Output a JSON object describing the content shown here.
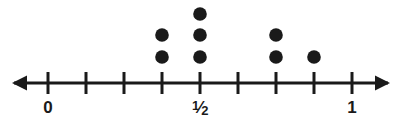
{
  "figure": {
    "name": "dot-plot-number-line",
    "width": 401,
    "height": 126,
    "background": "#ffffff",
    "ink_color": "#1a1a1a"
  },
  "axis": {
    "type": "number-line",
    "orientation": "horizontal",
    "y": 83,
    "line_start_x": 14,
    "line_end_x": 388,
    "stroke_width": 3,
    "left_arrowhead": true,
    "right_arrowhead": true,
    "tick_count": 9,
    "tick_spacing_px": 38,
    "tick_half_height": 11,
    "tick_x_positions": [
      48,
      86,
      124,
      162,
      200,
      238,
      276,
      314,
      352
    ],
    "tick_values": [
      0,
      0.125,
      0.25,
      0.375,
      0.5,
      0.625,
      0.75,
      0.875,
      1
    ],
    "labels": [
      {
        "text": "0",
        "x": 48,
        "y": 99,
        "value": 0
      },
      {
        "text": "1/2",
        "x": 200,
        "y": 99,
        "value": 0.5,
        "is_fraction": true,
        "numerator": "1",
        "denominator": "2"
      },
      {
        "text": "1",
        "x": 352,
        "y": 99,
        "value": 1
      }
    ]
  },
  "chart_data": {
    "type": "scatter",
    "subtype": "dot-plot",
    "title": "",
    "xlabel": "",
    "ylabel": "",
    "xlim": [
      0,
      1
    ],
    "grid": false,
    "legend": false,
    "dot_radius": 6.8,
    "dot_color": "#1a1a1a",
    "row_spacing_px": 22,
    "first_row_y": 57,
    "categories": [
      "3/8",
      "1/2",
      "3/4",
      "7/8"
    ],
    "x": [
      0.375,
      0.5,
      0.75,
      0.875
    ],
    "values": [
      2,
      3,
      2,
      1
    ],
    "stacks": [
      {
        "tick_index": 3,
        "x_px": 162,
        "value": 0.375,
        "label": "3/8",
        "count": 2,
        "dot_y": [
          57,
          35
        ]
      },
      {
        "tick_index": 4,
        "x_px": 200,
        "value": 0.5,
        "label": "1/2",
        "count": 3,
        "dot_y": [
          57,
          35,
          14
        ]
      },
      {
        "tick_index": 6,
        "x_px": 276,
        "value": 0.75,
        "label": "3/4",
        "count": 2,
        "dot_y": [
          57,
          35
        ]
      },
      {
        "tick_index": 7,
        "x_px": 314,
        "value": 0.875,
        "label": "7/8",
        "count": 1,
        "dot_y": [
          57
        ]
      }
    ],
    "total_dots": 8
  }
}
